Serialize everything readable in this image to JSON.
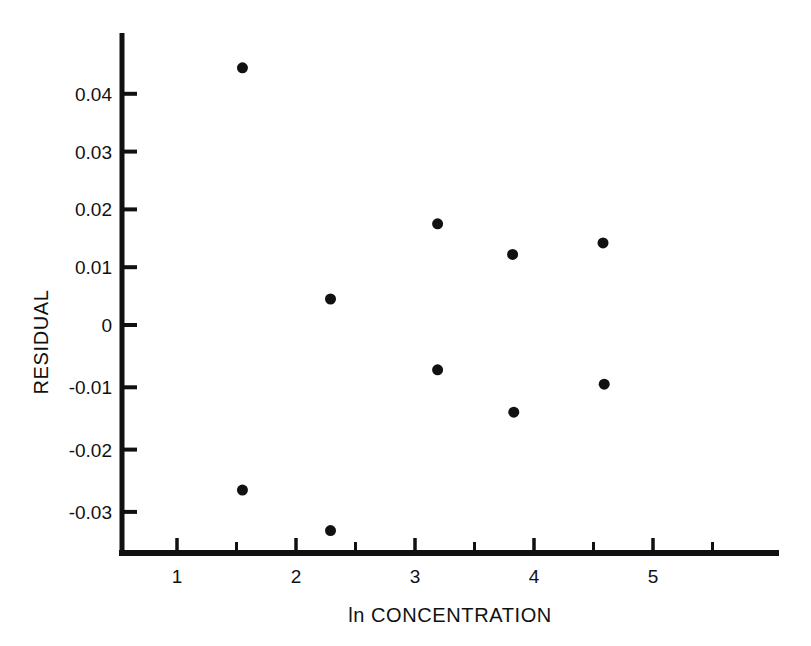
{
  "chart_data": {
    "type": "scatter",
    "title": "",
    "xlabel": "ln CONCENTRATION",
    "ylabel": "RESIDUAL",
    "xlim": [
      0.5,
      5.55
    ],
    "ylim": [
      -0.0375,
      0.0475
    ],
    "grid": false,
    "legend": null,
    "x_ticks_major": [
      1,
      2,
      3,
      4,
      5
    ],
    "x_tick_labels": [
      "1",
      "2",
      "3",
      "4",
      "5"
    ],
    "x_ticks_minor": [
      1.5,
      2.5,
      3.5,
      4.5,
      5.5
    ],
    "y_ticks_major": [
      0.04,
      0.03,
      0.02,
      0.01,
      0,
      -0.01,
      -0.02,
      -0.03
    ],
    "y_tick_labels": [
      "0.04",
      "0.03",
      "0.02",
      "0.01",
      "0",
      "-0.01",
      "-0.02",
      "-0.03"
    ],
    "marker": "filled-circle",
    "marker_color": "#111111",
    "marker_size_px": 11,
    "points": [
      {
        "x": 1.55,
        "y": 0.0445
      },
      {
        "x": 1.55,
        "y": -0.0265
      },
      {
        "x": 2.29,
        "y": 0.0045
      },
      {
        "x": 2.29,
        "y": -0.033
      },
      {
        "x": 3.19,
        "y": 0.0175
      },
      {
        "x": 3.19,
        "y": -0.0072
      },
      {
        "x": 3.82,
        "y": 0.0122
      },
      {
        "x": 3.83,
        "y": -0.014
      },
      {
        "x": 4.58,
        "y": 0.0142
      },
      {
        "x": 4.59,
        "y": -0.0095
      }
    ]
  },
  "axes": {
    "x_axis_name": "ln CONCENTRATION",
    "y_axis_name": "RESIDUAL"
  },
  "colors": {
    "ink": "#111111",
    "background": "#ffffff"
  }
}
